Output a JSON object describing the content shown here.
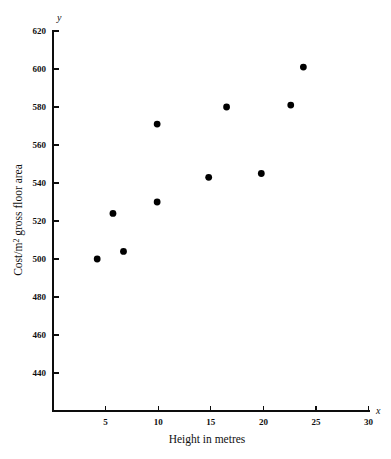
{
  "chart_data": {
    "type": "scatter",
    "title": "",
    "xlabel": "Height in metres",
    "ylabel": "Cost/m2 gross floor area",
    "ylabel_parts": {
      "prefix": "Cost/m",
      "superscript": "2",
      "suffix": " gross floor area"
    },
    "x_axis_name": "x",
    "y_axis_name": "y",
    "xlim": [
      0,
      30
    ],
    "ylim": [
      430,
      620
    ],
    "xticks": [
      5,
      10,
      15,
      20,
      25,
      30
    ],
    "xtick_labels": [
      "5",
      "10",
      "15",
      "20",
      "25",
      "30"
    ],
    "yticks": [
      440,
      460,
      480,
      500,
      520,
      540,
      560,
      580,
      600,
      620
    ],
    "ytick_labels": [
      "440",
      "460",
      "480",
      "500",
      "520",
      "540",
      "560",
      "580",
      "600",
      "620"
    ],
    "grid": false,
    "legend": null,
    "marker": {
      "shape": "circle",
      "color": "#000000",
      "radius": 3.4
    },
    "points": [
      {
        "x": 4.2,
        "y": 500
      },
      {
        "x": 5.7,
        "y": 524
      },
      {
        "x": 6.7,
        "y": 504
      },
      {
        "x": 9.9,
        "y": 530
      },
      {
        "x": 9.9,
        "y": 571
      },
      {
        "x": 14.8,
        "y": 543
      },
      {
        "x": 16.5,
        "y": 580
      },
      {
        "x": 19.8,
        "y": 545
      },
      {
        "x": 22.6,
        "y": 581
      },
      {
        "x": 23.8,
        "y": 601
      }
    ],
    "series": [
      {
        "name": "Cost vs height",
        "x": [
          4.2,
          5.7,
          6.7,
          9.9,
          9.9,
          14.8,
          16.5,
          19.8,
          22.6,
          23.8
        ],
        "values": [
          500,
          524,
          504,
          530,
          571,
          543,
          580,
          545,
          581,
          601
        ]
      }
    ]
  },
  "caption": {
    "text": ""
  }
}
